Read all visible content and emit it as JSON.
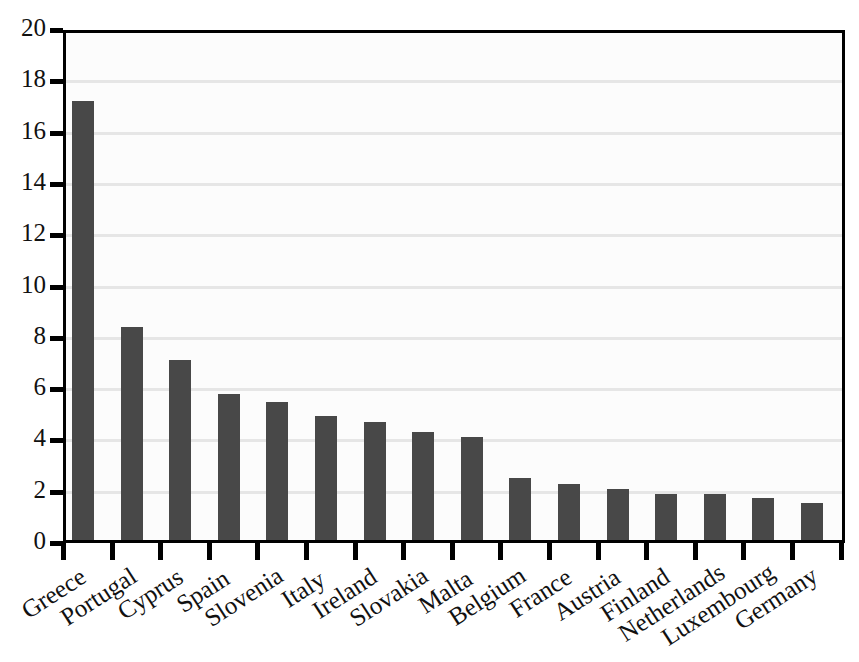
{
  "chart_data": {
    "type": "bar",
    "title": "",
    "subtitle": "",
    "xlabel": "",
    "ylabel": "",
    "ylim": [
      0,
      20
    ],
    "ytick_step": 2,
    "yticks": [
      "20",
      "18",
      "16",
      "14",
      "12",
      "10",
      "8",
      "6",
      "4",
      "2",
      "0"
    ],
    "grid": true,
    "grid_axis": "y",
    "legend": false,
    "legend_position": "none",
    "orientation": "vertical",
    "sorted": "descending",
    "categories": [
      "Greece",
      "Portugal",
      "Cyprus",
      "Spain",
      "Slovenia",
      "Italy",
      "Ireland",
      "Slovakia",
      "Malta",
      "Belgium",
      "France",
      "Austria",
      "Finland",
      "Netherlands",
      "Luxembourg",
      "Germany"
    ],
    "values": [
      17.1,
      8.3,
      7.0,
      5.7,
      5.4,
      4.85,
      4.6,
      4.2,
      4.0,
      2.4,
      2.2,
      2.0,
      1.8,
      1.8,
      1.65,
      1.45
    ],
    "bar_color": "#484848",
    "plot_background": "#fcfcfc",
    "gridline_color": "#e6e6e6",
    "axis_color": "#000000"
  },
  "style": {
    "plot_left": 63,
    "plot_top": 30,
    "plot_width": 782,
    "plot_height": 513,
    "baseline_y": 543,
    "px_per_unit": 25.65,
    "bar_width": 22,
    "first_bar_center": 83,
    "bar_spacing": 48.6,
    "label_rotation_deg": -33
  }
}
